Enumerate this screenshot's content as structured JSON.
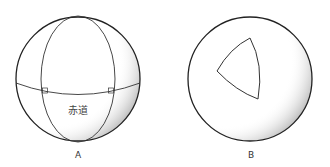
{
  "figures": [
    {
      "id": "A",
      "label": "A",
      "equator_label": "赤道"
    },
    {
      "id": "B",
      "label": "B"
    }
  ],
  "colors": {
    "stroke": "#222222",
    "shade": "#bdbdbd"
  }
}
